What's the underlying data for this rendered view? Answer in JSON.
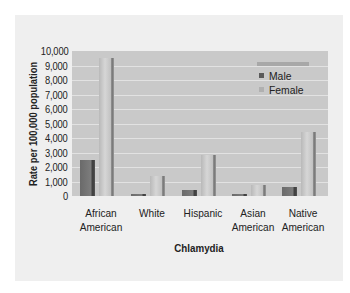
{
  "chart_data": {
    "type": "bar",
    "title": "Chlamydia",
    "xlabel": "Chlamydia",
    "ylabel": "Rate per 100,000 population",
    "ylim": [
      0,
      10000
    ],
    "yticks": [
      "10,000",
      "9,000",
      "8,000",
      "7,000",
      "6,000",
      "5,000",
      "4,000",
      "3,000",
      "2,000",
      "1,000",
      "0"
    ],
    "grid": true,
    "legend_position": "upper right inside",
    "categories": [
      "African American",
      "White",
      "Hispanic",
      "Asian American",
      "Native American"
    ],
    "category_lines": [
      [
        "African",
        "American"
      ],
      [
        "White",
        ""
      ],
      [
        "Hispanic",
        ""
      ],
      [
        "Asian",
        "American"
      ],
      [
        "Native",
        "American"
      ]
    ],
    "series": [
      {
        "name": "Male",
        "color": "#6e6e6e",
        "values": [
          2500,
          150,
          400,
          100,
          650
        ]
      },
      {
        "name": "Female",
        "color": "#c8c8c8",
        "values": [
          9550,
          1400,
          2800,
          750,
          4400
        ]
      }
    ]
  },
  "legend": {
    "male": "Male",
    "female": "Female"
  },
  "colors": {
    "panel_bg": "#efefef",
    "plot_bg": "#c9c9c9",
    "gridline": "#e2e2e2",
    "male": "#6e6e6e",
    "female": "#c8c8c8"
  }
}
